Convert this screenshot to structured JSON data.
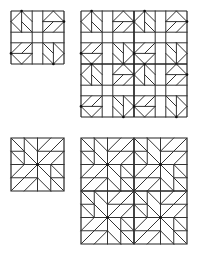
{
  "diagram": {
    "colors": {
      "line": "#333333",
      "border": "#222222",
      "background": "#ffffff"
    },
    "panels": [
      {
        "id": "block-a-single",
        "pattern": "corner-star",
        "x": 11,
        "y": 11,
        "size": 53,
        "repeat": 1
      },
      {
        "id": "block-a-tiled",
        "pattern": "corner-star",
        "x": 81,
        "y": 11,
        "size": 53,
        "repeat": 2
      },
      {
        "id": "block-b-single",
        "pattern": "pinwheel-star",
        "x": 11,
        "y": 138,
        "size": 53,
        "repeat": 1
      },
      {
        "id": "block-b-tiled",
        "pattern": "pinwheel-star",
        "x": 81,
        "y": 138,
        "size": 53,
        "repeat": 2
      }
    ]
  }
}
